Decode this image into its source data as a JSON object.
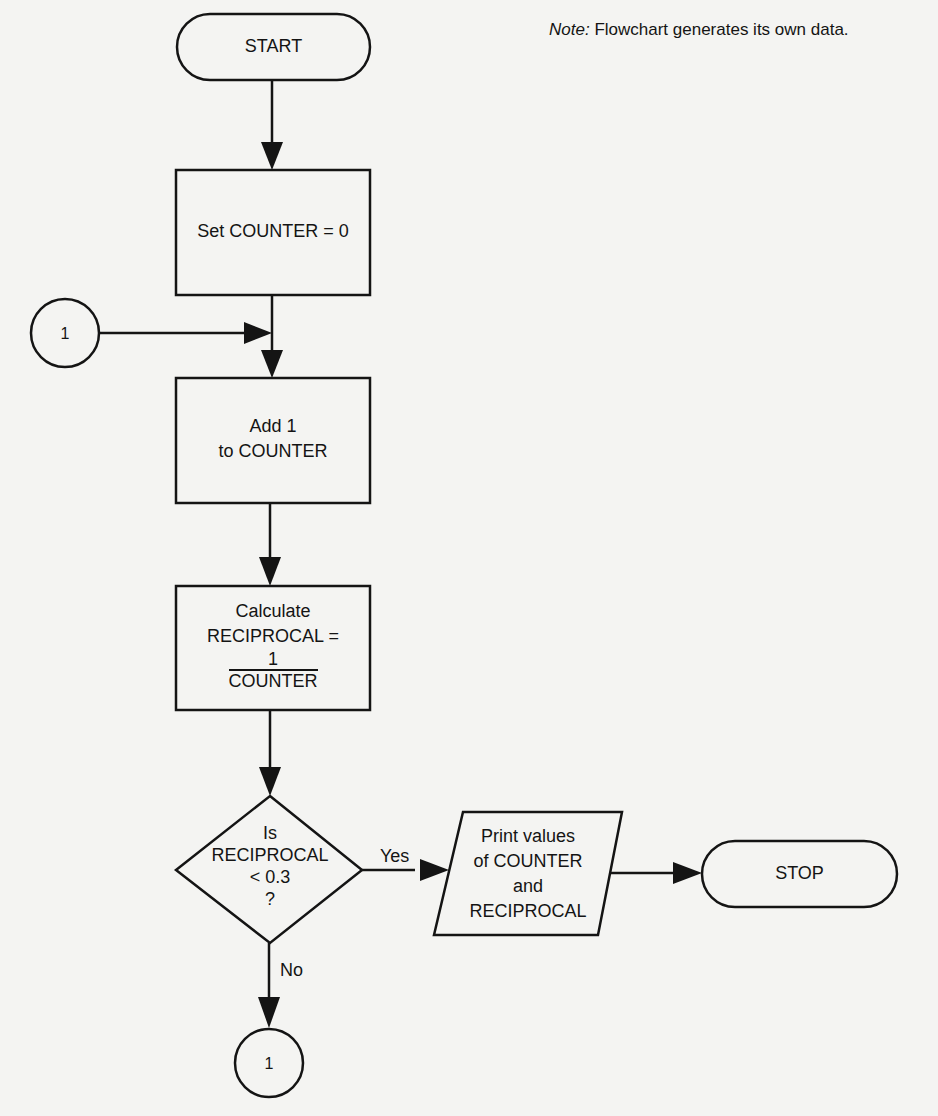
{
  "note": {
    "prefix": "Note:",
    "text": "Flowchart generates its own data."
  },
  "nodes": {
    "start": {
      "type": "terminator",
      "label": "START"
    },
    "set_counter": {
      "type": "process",
      "label": "Set COUNTER = 0"
    },
    "connector_in": {
      "type": "connector",
      "label": "1"
    },
    "add_one": {
      "type": "process",
      "line1": "Add 1",
      "line2": "to COUNTER"
    },
    "calculate": {
      "type": "process",
      "line1": "Calculate",
      "line2": "RECIPROCAL =",
      "numerator": "1",
      "denominator": "COUNTER"
    },
    "decision": {
      "type": "decision",
      "line1": "Is",
      "line2": "RECIPROCAL",
      "line3": "< 0.3",
      "line4": "?"
    },
    "print": {
      "type": "io",
      "line1": "Print values",
      "line2": "of COUNTER",
      "line3": "and",
      "line4": "RECIPROCAL"
    },
    "stop": {
      "type": "terminator",
      "label": "STOP"
    },
    "connector_out": {
      "type": "connector",
      "label": "1"
    }
  },
  "edges": {
    "yes_label": "Yes",
    "no_label": "No"
  },
  "colors": {
    "stroke": "#141414",
    "paper": "#f4f4f2"
  }
}
